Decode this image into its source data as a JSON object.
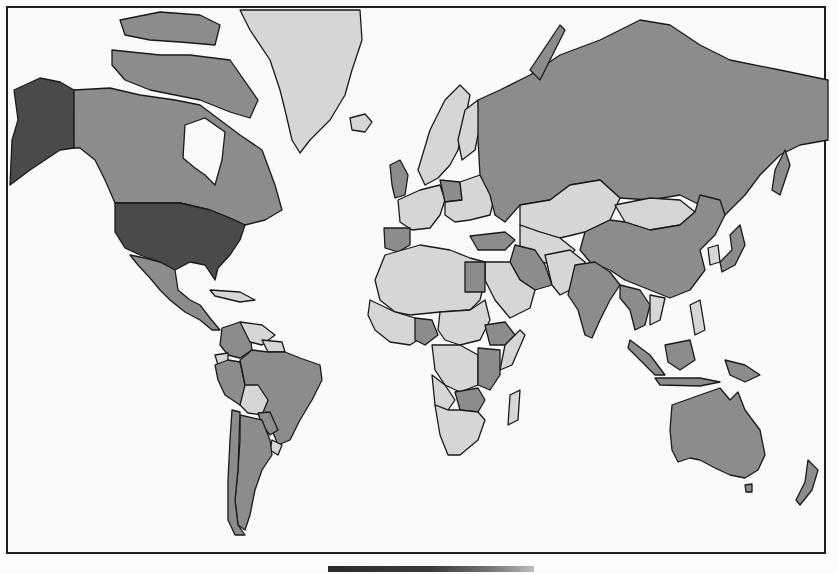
{
  "map": {
    "type": "choropleth",
    "projection": "mercator",
    "palette": {
      "dark": "#4a4a4a",
      "medium": "#8a8a8a",
      "light": "#d4d4d4",
      "ocean": "#fafafa",
      "border": "#1a1a1a"
    },
    "legend_visible": false,
    "classes": [
      {
        "shade": "dark",
        "regions": [
          "United States",
          "Alaska"
        ]
      },
      {
        "shade": "medium",
        "regions": [
          "Canada",
          "Russia",
          "China",
          "India",
          "Brazil",
          "Australia",
          "Mexico",
          "Colombia",
          "Peru",
          "Argentina",
          "Chile",
          "Spain",
          "Poland",
          "United Kingdom",
          "Turkey",
          "Iran",
          "Egypt",
          "Nigeria",
          "Ethiopia",
          "Kenya",
          "Tanzania",
          "Zambia",
          "Zimbabwe",
          "Indonesia",
          "Thailand",
          "Myanmar",
          "Papua New Guinea",
          "New Zealand",
          "Japan",
          "Sakhalin",
          "Kamchatka"
        ]
      },
      {
        "shade": "light",
        "regions": [
          "Greenland",
          "Iceland",
          "Mongolia",
          "Kazakhstan",
          "Central Asia",
          "Scandinavia",
          "Western Europe",
          "Saudi Arabia",
          "North Africa",
          "Sahel",
          "Sudan",
          "DR Congo",
          "Angola",
          "Namibia",
          "Botswana",
          "South Africa",
          "Madagascar",
          "Venezuela",
          "Bolivia",
          "Uruguay",
          "Ecuador",
          "Guianas",
          "Caribbean",
          "Korea",
          "Vietnam",
          "Philippines",
          "Pakistan",
          "Afghanistan",
          "Arabian Peninsula"
        ]
      }
    ]
  },
  "bottom_bar": {
    "visible": true
  }
}
